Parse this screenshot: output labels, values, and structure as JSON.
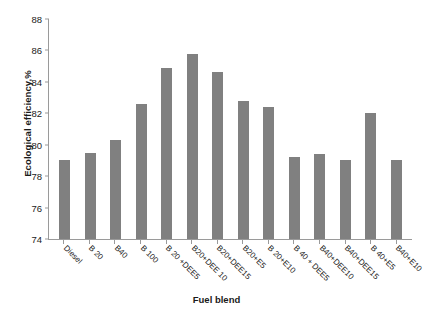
{
  "chart_data": {
    "type": "bar",
    "title": "",
    "xlabel": "Fuel blend",
    "ylabel": "Ecological efficiency,%",
    "ylim": [
      74,
      88
    ],
    "ytick_step": 2,
    "yticks": [
      88,
      86,
      84,
      82,
      80,
      78,
      76,
      74
    ],
    "grid": false,
    "legend": null,
    "bar_color": "#808080",
    "axis_color": "#9a9a9a",
    "categories": [
      "Diesel",
      "B 20",
      "B40",
      "B 100",
      "B 20 +DEE5",
      "B20+DEE 10",
      "B20+DEE15",
      "B20+E5",
      "B 20+E10",
      "B 40 + DEE5",
      "B40+DEE10",
      "B40+DEE15",
      "B 40+E5",
      "B40+E10"
    ],
    "values": [
      79.0,
      79.5,
      80.3,
      82.6,
      84.9,
      85.8,
      84.6,
      82.8,
      82.4,
      79.2,
      79.4,
      79.0,
      82.0,
      79.0
    ]
  }
}
